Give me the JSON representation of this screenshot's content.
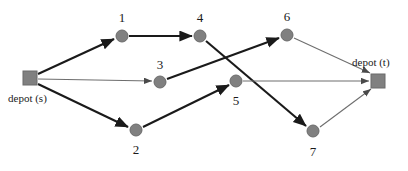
{
  "diagram": {
    "background_color": "#ffffff",
    "node_color": "#808080",
    "node_stroke_color": "#6b6b6b",
    "edge_color_thick": "#1a1a1a",
    "edge_color_thin": "#6e6e6e",
    "depot_source": {
      "id": "s",
      "label": "depot (s)",
      "shape": "square",
      "x": 30,
      "y": 78,
      "size": 14,
      "label_x": 8,
      "label_y": 93
    },
    "depot_sink": {
      "id": "t",
      "label": "depot (t)",
      "shape": "square",
      "x": 378,
      "y": 81,
      "size": 14,
      "label_x": 352,
      "label_y": 57
    },
    "nodes": [
      {
        "id": "1",
        "label": "1",
        "x": 122,
        "y": 36,
        "r": 6,
        "label_x": 112,
        "label_y": 11
      },
      {
        "id": "2",
        "label": "2",
        "x": 136,
        "y": 130,
        "r": 6,
        "label_x": 126,
        "label_y": 143
      },
      {
        "id": "3",
        "label": "3",
        "x": 160,
        "y": 82,
        "r": 6,
        "label_x": 150,
        "label_y": 58
      },
      {
        "id": "4",
        "label": "4",
        "x": 200,
        "y": 36,
        "r": 6,
        "label_x": 190,
        "label_y": 11
      },
      {
        "id": "5",
        "label": "5",
        "x": 236,
        "y": 81,
        "r": 6,
        "label_x": 226,
        "label_y": 94
      },
      {
        "id": "6",
        "label": "6",
        "x": 287,
        "y": 35,
        "r": 6,
        "label_x": 277,
        "label_y": 10
      },
      {
        "id": "7",
        "label": "7",
        "x": 313,
        "y": 131,
        "r": 6,
        "label_x": 303,
        "label_y": 145
      }
    ],
    "edges": [
      {
        "from": "s",
        "to": "1",
        "x1": 38,
        "y1": 74,
        "x2": 114,
        "y2": 39,
        "weight": "thick"
      },
      {
        "from": "s",
        "to": "3",
        "x1": 38,
        "y1": 79,
        "x2": 152,
        "y2": 81,
        "weight": "thin"
      },
      {
        "from": "s",
        "to": "2",
        "x1": 38,
        "y1": 84,
        "x2": 128,
        "y2": 127,
        "weight": "thick"
      },
      {
        "from": "1",
        "to": "4",
        "x1": 129,
        "y1": 36,
        "x2": 192,
        "y2": 36,
        "weight": "thick"
      },
      {
        "from": "3",
        "to": "6",
        "x1": 167,
        "y1": 79,
        "x2": 279,
        "y2": 38,
        "weight": "thick"
      },
      {
        "from": "4",
        "to": "7",
        "x1": 206,
        "y1": 41,
        "x2": 306,
        "y2": 126,
        "weight": "thick"
      },
      {
        "from": "2",
        "to": "5",
        "x1": 143,
        "y1": 127,
        "x2": 229,
        "y2": 85,
        "weight": "thick"
      },
      {
        "from": "5",
        "to": "t",
        "x1": 243,
        "y1": 81,
        "x2": 369,
        "y2": 81,
        "weight": "thin"
      },
      {
        "from": "6",
        "to": "t",
        "x1": 294,
        "y1": 38,
        "x2": 370,
        "y2": 73,
        "weight": "thin"
      },
      {
        "from": "7",
        "to": "t",
        "x1": 320,
        "y1": 127,
        "x2": 371,
        "y2": 89,
        "weight": "thin"
      }
    ]
  }
}
